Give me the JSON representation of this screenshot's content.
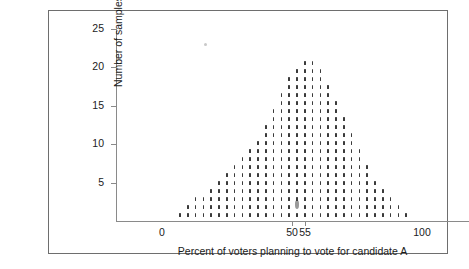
{
  "chart_data": {
    "type": "scatter",
    "title": "",
    "subtitle": "",
    "xlabel": "Percent of voters planning to vote for candidate A",
    "ylabel": "Number of samples",
    "xlim": [
      0,
      100
    ],
    "ylim": [
      0,
      25
    ],
    "grid": false,
    "legend": null,
    "x_tick_labels": [
      "0",
      "50",
      "55",
      "100"
    ],
    "x_tick_values": [
      0,
      50,
      55,
      100
    ],
    "y_tick_labels": [
      "5",
      "10",
      "15",
      "20",
      "25"
    ],
    "y_tick_values": [
      5,
      10,
      15,
      20,
      25
    ],
    "plot_style": "dot plot (stacked dots, one dot per sample)",
    "categories": [
      7,
      10,
      13,
      16,
      19,
      22,
      25,
      28,
      31,
      34,
      37,
      40,
      43,
      46,
      49,
      52,
      55,
      58,
      61,
      64,
      67,
      70,
      73,
      76,
      79,
      82,
      85,
      88,
      91,
      94
    ],
    "values": [
      1,
      2,
      3,
      3,
      4,
      5,
      6,
      7,
      8,
      9,
      10,
      12,
      14,
      16,
      18,
      19,
      20,
      20,
      19,
      17,
      15,
      13,
      11,
      9,
      7,
      5,
      4,
      3,
      2,
      1
    ],
    "highlight": {
      "x": 52,
      "y": 2,
      "note": "one sample dot drawn larger/grey"
    },
    "annotations": []
  },
  "figure": {
    "frame_border_color": "#6e6e6e",
    "axis_color": "#8a8a8a",
    "dot_color": "#3a3a3a",
    "highlight_color": "#9a9a9a",
    "background": "#ffffff"
  }
}
